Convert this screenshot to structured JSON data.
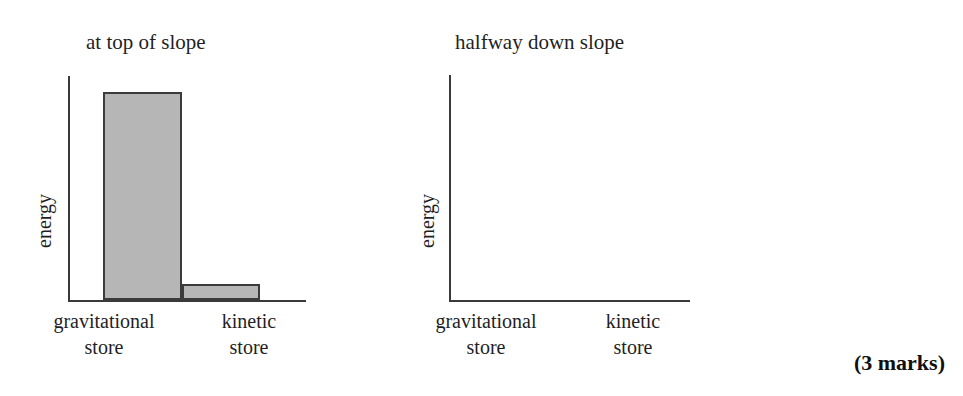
{
  "question": {
    "marks_note": "(3 marks)"
  },
  "charts": [
    {
      "id": "at-top-of-slope",
      "title": "at top of slope",
      "ylabel": "energy",
      "categories": [
        {
          "line1": "gravitational",
          "line2": "store"
        },
        {
          "line1": "kinetic",
          "line2": "store"
        }
      ]
    },
    {
      "id": "halfway-down-slope",
      "title": "halfway down slope",
      "ylabel": "energy",
      "categories": [
        {
          "line1": "gravitational",
          "line2": "store"
        },
        {
          "line1": "kinetic",
          "line2": "store"
        }
      ]
    }
  ],
  "chart_data": [
    {
      "type": "bar",
      "title": "at top of slope",
      "xlabel": "",
      "ylabel": "energy",
      "categories": [
        "gravitational store",
        "kinetic store"
      ],
      "values": [
        93,
        7
      ],
      "ylim": [
        0,
        100
      ],
      "grid": false,
      "legend": "none",
      "axis_ticks": "none",
      "bar_fill": "#b6b6b6",
      "bar_stroke": "#3b3b3b"
    },
    {
      "type": "bar",
      "title": "halfway down slope",
      "xlabel": "",
      "ylabel": "energy",
      "categories": [
        "gravitational store",
        "kinetic store"
      ],
      "values": [
        0,
        0
      ],
      "ylim": [
        0,
        100
      ],
      "grid": false,
      "legend": "none",
      "axis_ticks": "none",
      "note": "empty axes - bars to be drawn by the student",
      "bar_fill": "#b6b6b6",
      "bar_stroke": "#3b3b3b"
    }
  ]
}
